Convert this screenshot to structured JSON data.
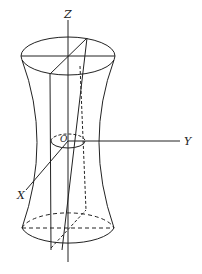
{
  "diagram": {
    "labels": {
      "z_axis": "Z",
      "y_axis": "Y",
      "x_axis": "X",
      "origin": "O"
    },
    "colors": {
      "stroke": "#222222",
      "background": "#ffffff"
    }
  }
}
